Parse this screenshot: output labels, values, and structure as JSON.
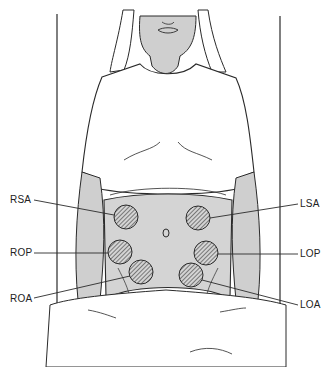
{
  "figure": {
    "colors": {
      "skin": "#cfcfcf",
      "line": "#2a2a2a",
      "hatch": "#3a3a3a",
      "background": "#ffffff"
    },
    "labels": {
      "rsa": "RSA",
      "rop": "ROP",
      "roa": "ROA",
      "lsa": "LSA",
      "lop": "LOP",
      "loa": "LOA"
    }
  }
}
